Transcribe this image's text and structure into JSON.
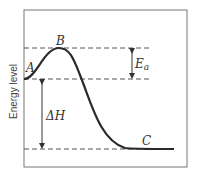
{
  "diagram": {
    "ylabel": "Energy level",
    "points": {
      "A": "A",
      "B": "B",
      "C": "C"
    },
    "annotations": {
      "activation_energy": "E",
      "activation_energy_sub": "a",
      "enthalpy": "ΔH"
    }
  },
  "colors": {
    "curve": "#2a2a2a",
    "dash": "#555555",
    "frame": "#777777"
  }
}
